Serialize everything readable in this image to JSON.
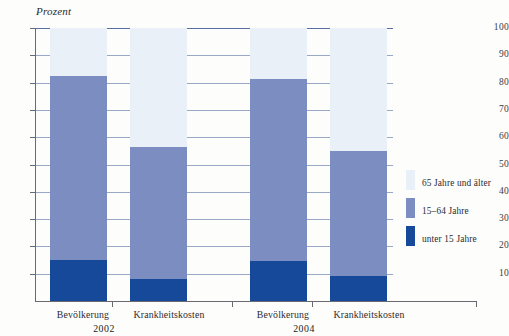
{
  "axis_unit_label": "Prozent",
  "legend": {
    "items": [
      {
        "label": "65 Jahre und älter",
        "color": "#e9f0f8",
        "key": "old"
      },
      {
        "label": "15–64 Jahre",
        "color": "#7b8dc1",
        "key": "mid"
      },
      {
        "label": "unter 15 Jahre",
        "color": "#17499b",
        "key": "young"
      }
    ]
  },
  "chart_data": {
    "type": "bar",
    "subtype": "stacked-column",
    "title": "",
    "xlabel": "",
    "ylabel": "Prozent",
    "ylim": [
      0,
      100
    ],
    "yticks": [
      10,
      20,
      30,
      40,
      50,
      60,
      70,
      80,
      90,
      100
    ],
    "ytick_labels": [
      "10",
      "20",
      "30",
      "40",
      "50",
      "60",
      "70",
      "80",
      "90",
      "100"
    ],
    "grid": true,
    "legend_position": "right",
    "groups": [
      "2002",
      "2004"
    ],
    "categories": [
      "Bevölkerung",
      "Krankheitskosten",
      "Bevölkerung",
      "Krankheitskosten"
    ],
    "category_groups": [
      "2002",
      "2002",
      "2004",
      "2004"
    ],
    "series": [
      {
        "name": "unter 15 Jahre",
        "color": "#17499b",
        "values": [
          15.0,
          8.0,
          14.5,
          9.0
        ]
      },
      {
        "name": "15–64 Jahre",
        "color": "#7b8dc1",
        "values": [
          67.5,
          48.5,
          67.0,
          46.0
        ]
      },
      {
        "name": "65 Jahre und älter",
        "color": "#e9f0f8",
        "values": [
          17.5,
          43.5,
          18.5,
          45.0
        ]
      }
    ],
    "stack_tops": {
      "young": [
        15.0,
        8.0,
        14.5,
        9.0
      ],
      "mid": [
        82.5,
        56.5,
        81.5,
        55.0
      ],
      "old": [
        100,
        100,
        100,
        100
      ]
    }
  },
  "x_labels": [
    {
      "text": "Bevölkerung",
      "left": 33,
      "width": 100
    },
    {
      "text": "Krankheitskosten",
      "left": 113,
      "width": 112
    },
    {
      "text": "Bevölkerung",
      "left": 233,
      "width": 100
    },
    {
      "text": "Krankheitskosten",
      "left": 313,
      "width": 112
    }
  ],
  "group_labels": [
    {
      "text": "2002",
      "left": 74,
      "width": 60
    },
    {
      "text": "2004",
      "left": 274,
      "width": 60
    }
  ]
}
